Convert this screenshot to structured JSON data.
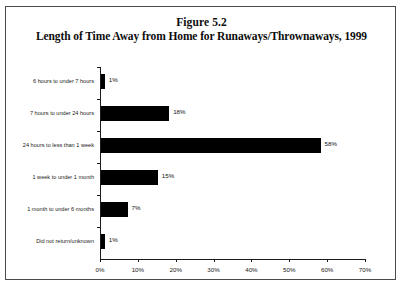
{
  "figure": {
    "number": "Figure 5.2",
    "title": "Length of Time Away from Home for Runaways/Thrownaways, 1999"
  },
  "chart_data": {
    "type": "bar",
    "orientation": "horizontal",
    "title": "Length of Time Away from Home for Runaways/Thrownaways, 1999",
    "subtitle": "Figure 5.2",
    "xlabel": "",
    "ylabel": "",
    "xlim": [
      0,
      70
    ],
    "grid": false,
    "legend": null,
    "bar_color": "#000000",
    "categories": [
      "6 hours to under 7 hours",
      "7 hours to under 24 hours",
      "24 hours to less than 1 week",
      "1 week to under 1 month",
      "1 month to under 6 months",
      "Did not return/unknown"
    ],
    "values": [
      1,
      18,
      58,
      15,
      7,
      1
    ],
    "data_labels": [
      "1%",
      "18%",
      "58%",
      "15%",
      "7%",
      "1%"
    ],
    "xticks": [
      0,
      10,
      20,
      30,
      40,
      50,
      60,
      70
    ],
    "xticklabels": [
      "0%",
      "10%",
      "20%",
      "30%",
      "40%",
      "50%",
      "60%",
      "70%"
    ]
  }
}
